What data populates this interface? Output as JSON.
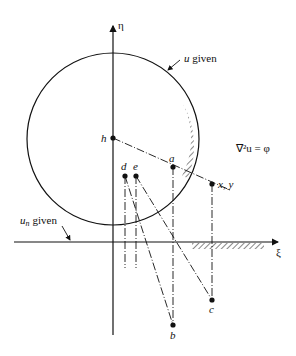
{
  "diagram": {
    "axes": {
      "horizontal_label": "ξ",
      "vertical_label": "η"
    },
    "equation": "∇²u = φ",
    "boundary_labels": {
      "circle": "u given",
      "axis": "given",
      "axis_var": "u",
      "axis_sub": "n"
    },
    "points": {
      "h": "h",
      "a": "a",
      "d": "d",
      "e": "e",
      "xy": "x, y",
      "b": "b",
      "c": "c"
    }
  }
}
